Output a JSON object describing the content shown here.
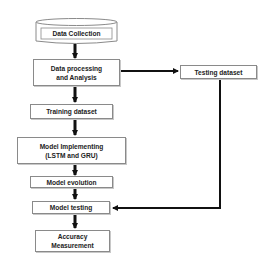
{
  "diagram": {
    "type": "flowchart",
    "nodes": {
      "data_collection": "Data Collection",
      "data_processing": {
        "line1": "Data processing",
        "line2": "and Analysis"
      },
      "testing_dataset": "Testing dataset",
      "training_dataset": "Training dataset",
      "model_implementing": {
        "line1": "Model Implementing",
        "line2": "(LSTM and GRU)"
      },
      "model_evolution": "Model evolution",
      "model_testing": "Model testing",
      "accuracy_measurement": {
        "line1": "Accuracy",
        "line2": "Measurement"
      }
    },
    "edges": [
      [
        "Data Collection",
        "Data processing and Analysis"
      ],
      [
        "Data processing and Analysis",
        "Testing dataset"
      ],
      [
        "Data processing and Analysis",
        "Training dataset"
      ],
      [
        "Training dataset",
        "Model Implementing (LSTM and GRU)"
      ],
      [
        "Model Implementing (LSTM and GRU)",
        "Model evolution"
      ],
      [
        "Model evolution",
        "Model testing"
      ],
      [
        "Testing dataset",
        "Model testing"
      ],
      [
        "Model testing",
        "Accuracy Measurement"
      ]
    ],
    "colors": {
      "arrow": "#111111",
      "border": "#8a8a8a",
      "background": "#ffffff"
    }
  }
}
